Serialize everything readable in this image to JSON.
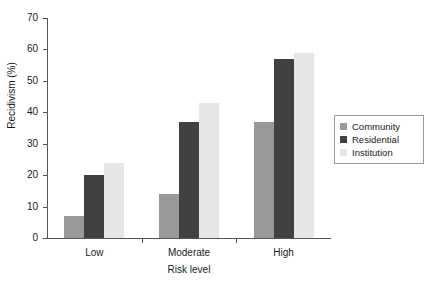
{
  "chart_data": {
    "type": "bar",
    "title": "",
    "subtitle": "",
    "xlabel": "Risk level",
    "ylabel": "Recidivism (%)",
    "categories": [
      "Low",
      "Moderate",
      "High"
    ],
    "series": [
      {
        "name": "Community",
        "values": [
          7,
          14,
          37
        ],
        "color": "#999999"
      },
      {
        "name": "Residential",
        "values": [
          20,
          37,
          57
        ],
        "color": "#414141"
      },
      {
        "name": "Institution",
        "values": [
          24,
          43,
          59
        ],
        "color": "#e6e6e6"
      }
    ],
    "ylim": [
      0,
      70
    ],
    "yticks": [
      0,
      10,
      20,
      30,
      40,
      50,
      60,
      70
    ],
    "ytick_labels": [
      "0",
      "10",
      "20",
      "30",
      "40",
      "50",
      "60",
      "70"
    ],
    "grid": false,
    "legend_position": "right",
    "legend_entries": [
      "Community",
      "Residential",
      "Institution"
    ],
    "background": "#ffffff",
    "axis_color": "#555555"
  }
}
